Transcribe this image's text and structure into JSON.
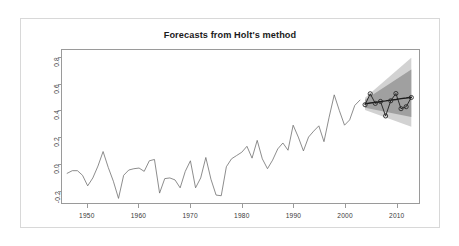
{
  "figure": {
    "title": "Forecasts from Holt's method",
    "background_color": "#ffffff",
    "frame_color": "#d8d8d8",
    "panel_border_color": "#9a9a9a"
  },
  "chart_data": {
    "type": "line",
    "title": "Forecasts from Holt's method",
    "xlabel": "",
    "ylabel": "",
    "xlim": [
      1945.0,
      2014.5
    ],
    "ylim": [
      -0.3,
      0.86
    ],
    "grid": false,
    "legend": null,
    "axis": {
      "x_ticks": [
        1950,
        1960,
        1970,
        1980,
        1990,
        2000,
        2010
      ],
      "x_tick_labels": [
        "1950",
        "1960",
        "1970",
        "1980",
        "1990",
        "2000",
        "2010"
      ],
      "y_ticks": [
        -0.2,
        0.0,
        0.2,
        0.4,
        0.6,
        0.8
      ],
      "y_tick_labels": [
        "-0.2",
        "0.0",
        "0.2",
        "0.4",
        "0.6",
        "0.8"
      ]
    },
    "series": [
      {
        "name": "historical",
        "role": "observed-history",
        "color": "#6f6f6f",
        "line_width": 0.8,
        "x": [
          1946,
          1947,
          1948,
          1949,
          1950,
          1951,
          1952,
          1953,
          1954,
          1955,
          1956,
          1957,
          1958,
          1959,
          1960,
          1961,
          1962,
          1963,
          1964,
          1965,
          1966,
          1967,
          1968,
          1969,
          1970,
          1971,
          1972,
          1973,
          1974,
          1975,
          1976,
          1977,
          1978,
          1979,
          1980,
          1981,
          1982,
          1983,
          1984,
          1985,
          1986,
          1987,
          1988,
          1989,
          1990,
          1991,
          1992,
          1993,
          1994,
          1995,
          1996,
          1997,
          1998,
          1999,
          2000,
          2001,
          2002,
          2003
        ],
        "values": [
          -0.075,
          -0.055,
          -0.055,
          -0.09,
          -0.17,
          -0.11,
          -0.02,
          0.09,
          -0.03,
          -0.135,
          -0.265,
          -0.09,
          -0.05,
          -0.04,
          -0.035,
          -0.06,
          0.02,
          0.03,
          -0.225,
          -0.115,
          -0.11,
          -0.125,
          -0.185,
          -0.06,
          0.02,
          -0.185,
          -0.11,
          0.045,
          -0.12,
          -0.24,
          -0.245,
          -0.025,
          0.035,
          0.06,
          0.085,
          0.13,
          0.04,
          0.175,
          0.035,
          -0.04,
          0.025,
          0.11,
          0.155,
          0.1,
          0.29,
          0.2,
          0.095,
          0.2,
          0.245,
          0.285,
          0.165,
          0.35,
          0.52,
          0.4,
          0.29,
          0.33,
          0.44,
          0.48
        ],
        "description": "Annual global temperature anomaly style series, gently rising with year-to-year oscillation."
      },
      {
        "name": "point-forecast",
        "role": "forecast-mean",
        "color": "#1b1b1b",
        "line_width": 1.4,
        "x": [
          2004,
          2005,
          2006,
          2007,
          2008,
          2009,
          2010,
          2011,
          2012,
          2013
        ],
        "values": [
          0.452,
          0.458,
          0.463,
          0.469,
          0.474,
          0.48,
          0.485,
          0.491,
          0.496,
          0.502
        ],
        "description": "Straight Holt linear-trend forecast line."
      },
      {
        "name": "forecast-observations",
        "role": "observed-future",
        "color": "#2a2a2a",
        "line_width": 1.0,
        "marker": "circle-open",
        "x": [
          2004,
          2005,
          2006,
          2007,
          2008,
          2009,
          2010,
          2011,
          2012,
          2013
        ],
        "values": [
          0.445,
          0.528,
          0.455,
          0.47,
          0.36,
          0.475,
          0.53,
          0.415,
          0.43,
          0.5
        ],
        "description": "Oscillating actual values overlaid on the forecast horizon, drawn with open circle markers."
      }
    ],
    "intervals": [
      {
        "name": "95% prediction interval",
        "level": 95,
        "color": "#d2d2d2",
        "x": [
          2004,
          2013
        ],
        "lower": [
          0.405,
          0.278
        ],
        "upper": [
          0.498,
          0.802
        ]
      },
      {
        "name": "80% prediction interval",
        "level": 80,
        "color": "#a0a0a0",
        "x": [
          2004,
          2013
        ],
        "lower": [
          0.422,
          0.352
        ],
        "upper": [
          0.482,
          0.712
        ]
      }
    ]
  }
}
